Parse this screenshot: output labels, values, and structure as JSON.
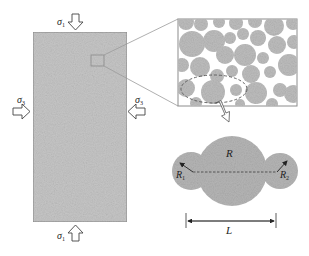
{
  "figure": {
    "type": "schematic",
    "specimen": {
      "description": "rectangular rock specimen under triaxial loading",
      "fill": "#c4c4c4",
      "stroke": "#8a8a8a"
    },
    "loads": {
      "top": {
        "symbol": "σ",
        "subscript": "1"
      },
      "bottom": {
        "symbol": "σ",
        "subscript": "1"
      },
      "left": {
        "symbol": "σ",
        "subscript": "3"
      },
      "right": {
        "symbol": "σ",
        "subscript": "3"
      }
    },
    "inset": {
      "description": "magnified view of particle packing",
      "particle_color": "#bdbdbd"
    },
    "cluster": {
      "fill": "#b3b3b3",
      "labels": {
        "center_radius": "R",
        "left_radius": "R",
        "left_radius_sub": "1",
        "right_radius": "R",
        "right_radius_sub": "2",
        "length": "L"
      }
    }
  }
}
